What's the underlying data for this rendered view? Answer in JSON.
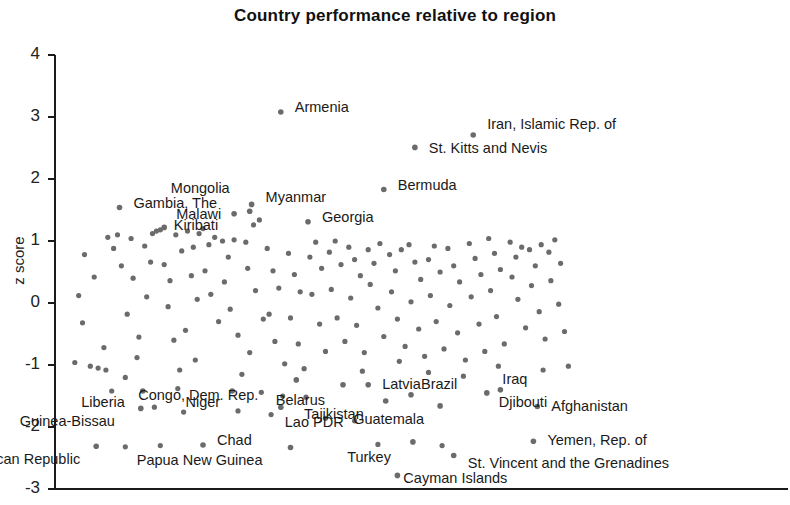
{
  "chart_data": {
    "type": "scatter",
    "title": "Country performance relative to region",
    "xlabel": "",
    "ylabel": "z score",
    "ylim": [
      -3,
      4
    ],
    "yticks": [
      4,
      3,
      2,
      1,
      0,
      -1,
      -2,
      -3
    ],
    "ytick_labels": [
      "4",
      "3",
      "2",
      "1",
      "0",
      "-1",
      "-2",
      "-3"
    ],
    "xlim": [
      0,
      300
    ],
    "xticks": [],
    "grid": false,
    "legend": null,
    "marker_color": "#6b6b6b",
    "axis_color": "#1a1a1a",
    "labeled_points": [
      {
        "name": "Armenia",
        "x": 110,
        "y": 3.08,
        "lx": 14,
        "ly": -6
      },
      {
        "name": "Iran, Islamic Rep. of",
        "x": 209,
        "y": 2.71,
        "lx": 14,
        "ly": -12
      },
      {
        "name": "St. Kitts and Nevis",
        "x": 179,
        "y": 2.51,
        "lx": 14,
        "ly": 0
      },
      {
        "name": "Bermuda",
        "x": 163,
        "y": 1.83,
        "lx": 14,
        "ly": -6
      },
      {
        "name": "Mongolia",
        "x": 94,
        "y": 1.48,
        "lx": -20,
        "ly": -24
      },
      {
        "name": "Myanmar",
        "x": 95,
        "y": 1.59,
        "lx": 14,
        "ly": -8
      },
      {
        "name": "Gambia, The",
        "x": 27,
        "y": 1.54,
        "lx": 14,
        "ly": -6
      },
      {
        "name": "Malawi",
        "x": 50,
        "y": 1.22,
        "lx": 12,
        "ly": -14
      },
      {
        "name": "Kiribati",
        "x": 86,
        "y": 1.44,
        "lx": -16,
        "ly": 10
      },
      {
        "name": "Georgia",
        "x": 124,
        "y": 1.31,
        "lx": 14,
        "ly": -6
      },
      {
        "name": "Liberia",
        "x": 39,
        "y": -1.42,
        "lx": -18,
        "ly": 10
      },
      {
        "name": "Niger",
        "x": 85,
        "y": -1.42,
        "lx": -12,
        "ly": 10
      },
      {
        "name": "Guinea-Bissau",
        "x": 38,
        "y": -1.7,
        "lx": -26,
        "ly": 12
      },
      {
        "name": "Congo, Dem. Rep.",
        "x": 118,
        "y": -1.24,
        "lx": -38,
        "ly": 14
      },
      {
        "name": "Lao PDR",
        "x": 110,
        "y": -1.68,
        "lx": 4,
        "ly": 14
      },
      {
        "name": "Belarus",
        "x": 142,
        "y": -1.32,
        "lx": -18,
        "ly": 14
      },
      {
        "name": "Latvia",
        "x": 155,
        "y": -1.32,
        "lx": 14,
        "ly": -2
      },
      {
        "name": "Tajikistan",
        "x": 164,
        "y": -1.58,
        "lx": -22,
        "ly": 12
      },
      {
        "name": "Brazil",
        "x": 177,
        "y": -1.48,
        "lx": 10,
        "ly": -12
      },
      {
        "name": "Guatemala",
        "x": 192,
        "y": -1.66,
        "lx": -16,
        "ly": 12
      },
      {
        "name": "Iraq",
        "x": 223,
        "y": -1.4,
        "lx": 2,
        "ly": -12
      },
      {
        "name": "Djibouti",
        "x": 216,
        "y": -1.45,
        "lx": 12,
        "ly": 8
      },
      {
        "name": "Afghanistan",
        "x": 242,
        "y": -1.67,
        "lx": 14,
        "ly": -2
      },
      {
        "name": "Yemen, Rep. of",
        "x": 240,
        "y": -2.23,
        "lx": 14,
        "ly": -2
      },
      {
        "name": "Chad",
        "x": 70,
        "y": -2.29,
        "lx": 14,
        "ly": -6
      },
      {
        "name": "Central African Republic",
        "x": 15,
        "y": -2.31,
        "lx": -16,
        "ly": 12
      },
      {
        "name": "Papua New Guinea",
        "x": 115,
        "y": -2.33,
        "lx": -28,
        "ly": 12
      },
      {
        "name": "Turkey",
        "x": 178,
        "y": -2.24,
        "lx": -22,
        "ly": 14
      },
      {
        "name": "St. Vincent and the Grenadines",
        "x": 199,
        "y": -2.46,
        "lx": 14,
        "ly": 6
      },
      {
        "name": "Cayman Islands",
        "x": 170,
        "y": -2.78,
        "lx": 6,
        "ly": 2
      }
    ],
    "unlabeled_points": [
      [
        8,
        -0.32
      ],
      [
        12,
        -1.02
      ],
      [
        16,
        -1.05
      ],
      [
        20,
        -1.08
      ],
      [
        9,
        0.78
      ],
      [
        14,
        0.42
      ],
      [
        19,
        -0.72
      ],
      [
        24,
        0.88
      ],
      [
        28,
        0.6
      ],
      [
        31,
        -0.18
      ],
      [
        21,
        1.06
      ],
      [
        26,
        1.1
      ],
      [
        33,
        1.04
      ],
      [
        34,
        0.4
      ],
      [
        37,
        -0.55
      ],
      [
        40,
        0.92
      ],
      [
        43,
        0.66
      ],
      [
        46,
        1.16
      ],
      [
        44,
        1.12
      ],
      [
        48,
        1.18
      ],
      [
        41,
        0.1
      ],
      [
        36,
        -0.88
      ],
      [
        30,
        -1.2
      ],
      [
        23,
        -1.42
      ],
      [
        50,
        0.62
      ],
      [
        53,
        0.36
      ],
      [
        56,
        1.1
      ],
      [
        59,
        0.84
      ],
      [
        52,
        -0.06
      ],
      [
        55,
        -0.6
      ],
      [
        58,
        -1.08
      ],
      [
        62,
        1.16
      ],
      [
        65,
        0.9
      ],
      [
        68,
        1.12
      ],
      [
        64,
        0.44
      ],
      [
        67,
        0.06
      ],
      [
        61,
        -0.44
      ],
      [
        57,
        -1.38
      ],
      [
        70,
        1.2
      ],
      [
        73,
        0.94
      ],
      [
        76,
        1.06
      ],
      [
        71,
        0.52
      ],
      [
        74,
        0.14
      ],
      [
        78,
        -0.3
      ],
      [
        66,
        -0.92
      ],
      [
        80,
        1.0
      ],
      [
        83,
        0.74
      ],
      [
        86,
        1.02
      ],
      [
        81,
        0.34
      ],
      [
        84,
        -0.1
      ],
      [
        88,
        -0.52
      ],
      [
        90,
        -1.15
      ],
      [
        92,
        0.98
      ],
      [
        96,
        1.26
      ],
      [
        99,
        1.34
      ],
      [
        93,
        0.56
      ],
      [
        97,
        0.2
      ],
      [
        101,
        -0.26
      ],
      [
        94,
        -0.8
      ],
      [
        103,
        0.88
      ],
      [
        106,
        0.52
      ],
      [
        109,
        0.24
      ],
      [
        104,
        -0.18
      ],
      [
        107,
        -0.62
      ],
      [
        112,
        -0.98
      ],
      [
        100,
        -1.44
      ],
      [
        114,
        0.8
      ],
      [
        117,
        0.46
      ],
      [
        120,
        0.18
      ],
      [
        115,
        -0.24
      ],
      [
        119,
        -0.66
      ],
      [
        122,
        -1.06
      ],
      [
        111,
        -1.5
      ],
      [
        125,
        0.74
      ],
      [
        128,
        0.98
      ],
      [
        131,
        0.56
      ],
      [
        126,
        0.14
      ],
      [
        130,
        -0.34
      ],
      [
        133,
        -0.78
      ],
      [
        123,
        -1.52
      ],
      [
        135,
        0.82
      ],
      [
        138,
        1.0
      ],
      [
        141,
        0.62
      ],
      [
        136,
        0.22
      ],
      [
        139,
        -0.24
      ],
      [
        143,
        -0.62
      ],
      [
        145,
        0.9
      ],
      [
        148,
        0.7
      ],
      [
        151,
        0.44
      ],
      [
        146,
        0.08
      ],
      [
        149,
        -0.36
      ],
      [
        153,
        -0.8
      ],
      [
        155,
        0.86
      ],
      [
        158,
        0.64
      ],
      [
        161,
        0.96
      ],
      [
        156,
        0.3
      ],
      [
        160,
        -0.08
      ],
      [
        163,
        -0.54
      ],
      [
        152,
        -1.1
      ],
      [
        166,
        0.78
      ],
      [
        169,
        0.52
      ],
      [
        172,
        0.86
      ],
      [
        167,
        0.18
      ],
      [
        170,
        -0.26
      ],
      [
        174,
        -0.7
      ],
      [
        176,
        0.94
      ],
      [
        179,
        0.66
      ],
      [
        182,
        0.38
      ],
      [
        177,
        0.02
      ],
      [
        181,
        -0.42
      ],
      [
        184,
        -0.86
      ],
      [
        186,
        0.7
      ],
      [
        189,
        0.92
      ],
      [
        192,
        0.5
      ],
      [
        187,
        0.12
      ],
      [
        190,
        -0.3
      ],
      [
        194,
        -0.74
      ],
      [
        196,
        0.88
      ],
      [
        199,
        0.6
      ],
      [
        202,
        0.34
      ],
      [
        197,
        -0.04
      ],
      [
        201,
        -0.48
      ],
      [
        205,
        -0.92
      ],
      [
        207,
        0.96
      ],
      [
        210,
        0.72
      ],
      [
        213,
        0.46
      ],
      [
        208,
        0.1
      ],
      [
        212,
        -0.34
      ],
      [
        215,
        -0.78
      ],
      [
        217,
        1.04
      ],
      [
        220,
        0.8
      ],
      [
        223,
        0.54
      ],
      [
        218,
        0.2
      ],
      [
        221,
        -0.22
      ],
      [
        225,
        -0.66
      ],
      [
        228,
        0.98
      ],
      [
        231,
        0.74
      ],
      [
        234,
        0.9
      ],
      [
        229,
        0.42
      ],
      [
        232,
        0.06
      ],
      [
        236,
        -0.4
      ],
      [
        238,
        0.86
      ],
      [
        241,
        0.6
      ],
      [
        244,
        0.94
      ],
      [
        239,
        0.28
      ],
      [
        243,
        -0.14
      ],
      [
        246,
        -0.58
      ],
      [
        248,
        0.82
      ],
      [
        251,
        1.02
      ],
      [
        254,
        0.64
      ],
      [
        249,
        0.36
      ],
      [
        253,
        -0.02
      ],
      [
        256,
        -0.46
      ],
      [
        258,
        -1.02
      ],
      [
        45,
        -1.68
      ],
      [
        60,
        -1.76
      ],
      [
        88,
        -1.74
      ],
      [
        105,
        -1.8
      ],
      [
        133,
        -1.86
      ],
      [
        148,
        -1.9
      ],
      [
        160,
        -2.28
      ],
      [
        193,
        -2.3
      ],
      [
        30,
        -2.32
      ],
      [
        48,
        -2.3
      ],
      [
        6,
        0.12
      ],
      [
        4,
        -0.96
      ],
      [
        171,
        -0.94
      ],
      [
        186,
        -1.12
      ],
      [
        204,
        -1.18
      ],
      [
        222,
        -1.02
      ],
      [
        245,
        -1.08
      ]
    ]
  }
}
